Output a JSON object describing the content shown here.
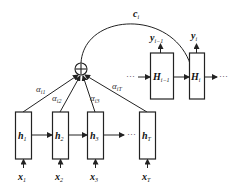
{
  "diagram": {
    "title": "",
    "type": "attention-mechanism",
    "context_vector": {
      "label": "c",
      "subscript": "i"
    },
    "sum_node": {
      "symbol": "⊕"
    },
    "encoder": {
      "hidden_states": [
        {
          "label": "h",
          "subscript": "1",
          "input": {
            "label": "x",
            "subscript": "1"
          },
          "weight": {
            "label": "α",
            "subscript": "i1"
          }
        },
        {
          "label": "h",
          "subscript": "2",
          "input": {
            "label": "x",
            "subscript": "2"
          },
          "weight": {
            "label": "α",
            "subscript": "i2"
          }
        },
        {
          "label": "h",
          "subscript": "3",
          "input": {
            "label": "x",
            "subscript": "3"
          },
          "weight": {
            "label": "α",
            "subscript": "i3"
          }
        },
        {
          "label": "h",
          "subscript": "T",
          "input": {
            "label": "x",
            "subscript": "T"
          },
          "weight": {
            "label": "α",
            "subscript": "iT"
          }
        }
      ],
      "ellipsis": "···"
    },
    "decoder": {
      "states": [
        {
          "label": "H",
          "subscript": "i−1",
          "output": {
            "label": "y",
            "subscript": "i−1"
          }
        },
        {
          "label": "H",
          "subscript": "i",
          "output": {
            "label": "y",
            "subscript": "i"
          }
        }
      ],
      "ellipsis_left": "···",
      "ellipsis_right": "···"
    }
  }
}
